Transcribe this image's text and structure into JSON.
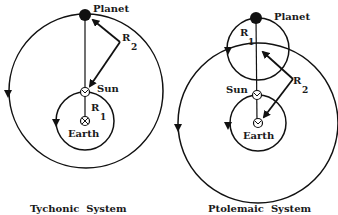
{
  "diagram": {
    "left": {
      "title": "Tychonic  System",
      "planet_label": "Planet",
      "sun_label": "Sun",
      "earth_label": "Earth",
      "r2_label": "R",
      "r2_sub": "2",
      "r1_label": "R",
      "r1_sub": "1"
    },
    "right": {
      "title": "Ptolemaic  System",
      "planet_label": "Planet",
      "sun_label": "Sun",
      "earth_label": "Earth",
      "r1_label": "R",
      "r1_sub": "1",
      "r2_label": "R",
      "r2_sub": "2"
    },
    "colors": {
      "line": "#111111",
      "background": "#ffffff"
    }
  }
}
